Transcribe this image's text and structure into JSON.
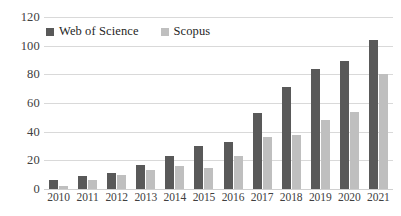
{
  "chart_data": {
    "type": "bar",
    "title": "",
    "subtitle": "",
    "xlabel": "",
    "ylabel": "",
    "categories": [
      "2010",
      "2011",
      "2012",
      "2013",
      "2014",
      "2015",
      "2016",
      "2017",
      "2018",
      "2019",
      "2020",
      "2021"
    ],
    "series": [
      {
        "name": "Web of Science",
        "color": "#595959",
        "values": [
          6,
          9,
          11,
          17,
          23,
          30,
          33,
          53,
          71,
          84,
          89,
          104
        ]
      },
      {
        "name": "Scopus",
        "color": "#BFBFBF",
        "values": [
          2,
          6,
          10,
          13,
          16,
          15,
          23,
          36,
          38,
          48,
          54,
          80
        ]
      }
    ],
    "ylim": [
      0,
      120
    ],
    "ytick_labels": [
      "0",
      "20",
      "40",
      "60",
      "80",
      "100",
      "120"
    ],
    "ytick_values": [
      0,
      20,
      40,
      60,
      80,
      100,
      120
    ],
    "grid": true,
    "grid_axis": "y",
    "legend_position": "top-left",
    "background_color": "#FFFFFF",
    "gridline_color": "#D9D9D9",
    "axis_text_color": "#404040"
  }
}
